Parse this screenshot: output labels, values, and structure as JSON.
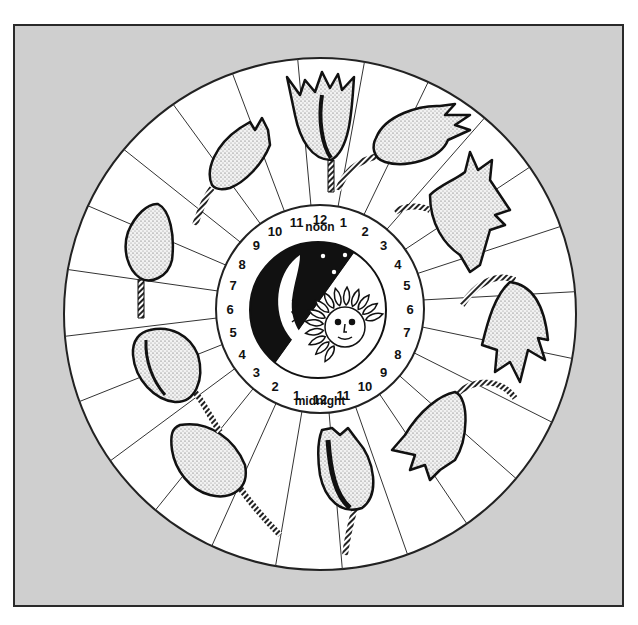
{
  "diagram": {
    "title": "",
    "colors": {
      "frame_background": "#cfcfcf",
      "frame_border": "#2a2a2a",
      "wheel_fill": "#ffffff",
      "ink": "#111111"
    },
    "clock": {
      "noon_label": "noon",
      "midnight_label": "midnight",
      "hours_upper": [
        "12",
        "1",
        "2",
        "3",
        "4",
        "5",
        "6",
        "7",
        "8",
        "9",
        "10",
        "11"
      ],
      "hours_lower": [
        "12",
        "1",
        "2",
        "3",
        "4",
        "5",
        "6",
        "7",
        "8",
        "9",
        "10",
        "11"
      ],
      "center_icons": [
        "moon-icon",
        "stars-icon",
        "sun-icon"
      ]
    },
    "tulips": [
      {
        "position": "top",
        "state": "open",
        "label": "tulip-noon-open"
      },
      {
        "position": "top-right",
        "state": "open-tilted",
        "label": "tulip-afternoon"
      },
      {
        "position": "right-upper",
        "state": "drooping",
        "label": "tulip-evening"
      },
      {
        "position": "right",
        "state": "drooping-closed",
        "label": "tulip-night-early"
      },
      {
        "position": "bottom-right",
        "state": "hanging",
        "label": "tulip-night-late"
      },
      {
        "position": "bottom",
        "state": "closed",
        "label": "tulip-midnight"
      },
      {
        "position": "bottom-left",
        "state": "closed-leaning",
        "label": "tulip-pre-dawn"
      },
      {
        "position": "left-lower",
        "state": "closed-bud",
        "label": "tulip-dawn"
      },
      {
        "position": "left",
        "state": "bud",
        "label": "tulip-morning"
      },
      {
        "position": "top-left",
        "state": "opening",
        "label": "tulip-late-morning"
      }
    ],
    "sectors": 24
  }
}
